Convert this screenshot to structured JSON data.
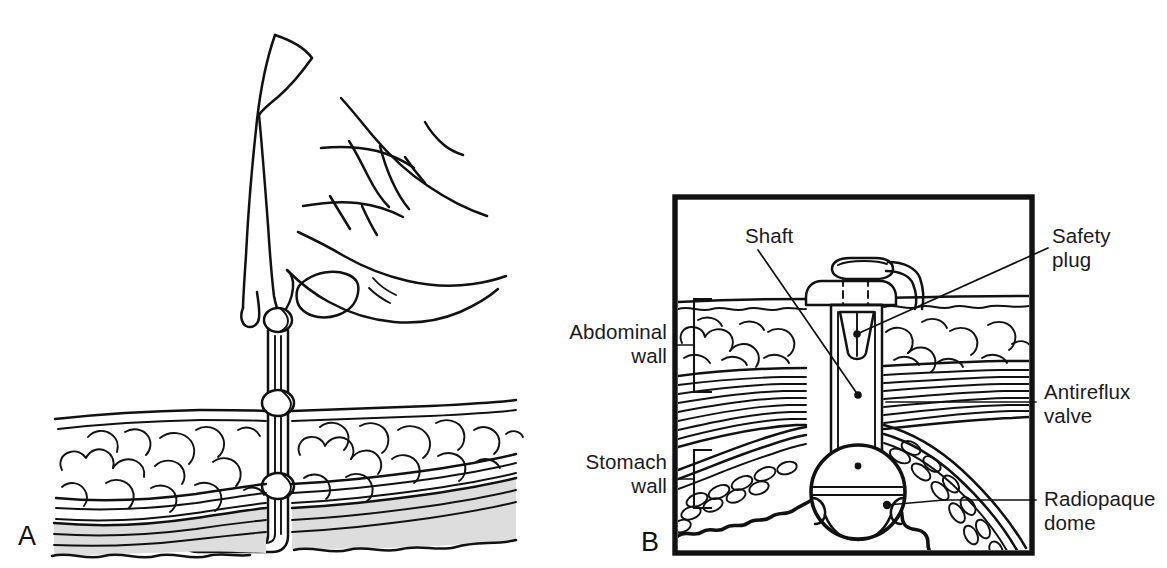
{
  "figure": {
    "background_color": "#ffffff",
    "ink_color": "#111111",
    "muscle_shade_color": "#dddddd",
    "width": 1167,
    "height": 568
  },
  "panels": [
    {
      "id": "A",
      "letter": "A",
      "caption": "Hand inserting gastrostomy button through abdominal and stomach wall",
      "framed": false
    },
    {
      "id": "B",
      "letter": "B",
      "caption": "Cross-section of seated gastrostomy button showing internal components",
      "framed": true
    }
  ],
  "labels": {
    "abdominal_wall": "Abdominal\nwall",
    "abdominal_wall_line1": "Abdominal",
    "abdominal_wall_line2": "wall",
    "stomach_wall_line1": "Stomach",
    "stomach_wall_line2": "wall",
    "shaft": "Shaft",
    "safety_plug_line1": "Safety",
    "safety_plug_line2": "plug",
    "antireflux_valve_line1": "Antireflux",
    "antireflux_valve_line2": "valve",
    "radiopaque_dome_line1": "Radiopaque",
    "radiopaque_dome_line2": "dome"
  },
  "anatomy_layers": [
    {
      "name": "skin-epidermis",
      "shaded": false
    },
    {
      "name": "subcutaneous-fat",
      "shaded": false
    },
    {
      "name": "fascia-muscle",
      "shaded": true
    },
    {
      "name": "peritoneum",
      "shaded": false
    },
    {
      "name": "stomach-wall-mucosa",
      "shaded": false
    }
  ],
  "device_parts": [
    {
      "name": "safety-plug",
      "panel": "B"
    },
    {
      "name": "shaft",
      "panel": "B"
    },
    {
      "name": "antireflux-valve",
      "panel": "B"
    },
    {
      "name": "radiopaque-dome",
      "panel": "B"
    },
    {
      "name": "catheter-tube",
      "panel": "A"
    },
    {
      "name": "tube-bulb",
      "panel": "A"
    }
  ]
}
